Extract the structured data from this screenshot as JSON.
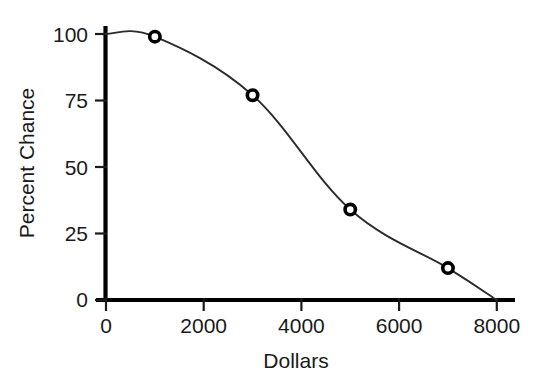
{
  "chart_data": {
    "type": "line",
    "title": "",
    "xlabel": "Dollars",
    "ylabel": "Percent Chance",
    "x": [
      0,
      1000,
      3000,
      5000,
      7000,
      8000
    ],
    "values": [
      100,
      99,
      77,
      34,
      12,
      0
    ],
    "series": [
      {
        "name": "Percent Chance",
        "x": [
          0,
          1000,
          3000,
          5000,
          7000,
          8000
        ],
        "values": [
          100,
          99,
          77,
          34,
          12,
          0
        ],
        "marker": "open-circle",
        "marker_points": [
          {
            "x": 1000,
            "y": 99
          },
          {
            "x": 3000,
            "y": 77
          },
          {
            "x": 5000,
            "y": 34
          },
          {
            "x": 7000,
            "y": 12
          }
        ]
      }
    ],
    "xlim": [
      0,
      8200
    ],
    "ylim": [
      0,
      100
    ],
    "xticks": [
      0,
      2000,
      4000,
      6000,
      8000
    ],
    "yticks": [
      0,
      25,
      50,
      75,
      100
    ],
    "xtick_labels": [
      "0",
      "2000",
      "4000",
      "6000",
      "8000"
    ],
    "ytick_labels": [
      "0",
      "25",
      "50",
      "75",
      "100"
    ],
    "grid": false,
    "legend": false,
    "legend_position": "none",
    "line_color": "#2b2b2b",
    "marker_edge_color": "#000000",
    "marker_face_color": "#ffffff",
    "axis_color": "#000000",
    "background_color": "#ffffff"
  },
  "axes": {
    "y_title": "Percent Chance",
    "x_title": "Dollars",
    "y_ticks": [
      {
        "label": "100",
        "value": 100
      },
      {
        "label": "75",
        "value": 75
      },
      {
        "label": "50",
        "value": 50
      },
      {
        "label": "25",
        "value": 25
      },
      {
        "label": "0",
        "value": 0
      }
    ],
    "x_ticks": [
      {
        "label": "0",
        "value": 0
      },
      {
        "label": "2000",
        "value": 2000
      },
      {
        "label": "4000",
        "value": 4000
      },
      {
        "label": "6000",
        "value": 6000
      },
      {
        "label": "8000",
        "value": 8000
      }
    ]
  }
}
